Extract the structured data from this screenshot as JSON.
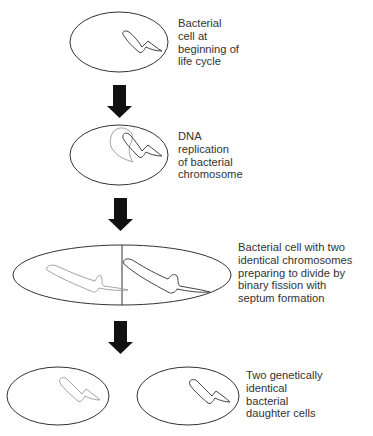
{
  "diagram": {
    "stages": [
      {
        "id": "stage-1",
        "label_lines": [
          "Bacterial",
          "cell at",
          "beginning of",
          "life cycle"
        ]
      },
      {
        "id": "stage-2",
        "label_lines": [
          "DNA",
          "replication",
          "of bacterial",
          "chromosome"
        ]
      },
      {
        "id": "stage-3",
        "label_lines": [
          "Bacterial cell with two",
          "identical chromosomes",
          "preparing to divide by",
          "binary fission with",
          "septum formation"
        ]
      },
      {
        "id": "stage-4",
        "label_lines": [
          "Two genetically",
          "identical",
          "bacterial",
          "daughter cells"
        ]
      }
    ],
    "arrows": [
      {
        "from": "stage-1",
        "to": "stage-2",
        "icon": "down-arrow-icon"
      },
      {
        "from": "stage-2",
        "to": "stage-3",
        "icon": "down-arrow-icon"
      },
      {
        "from": "stage-3",
        "to": "stage-4",
        "icon": "down-arrow-icon"
      }
    ],
    "colors": {
      "outline": "#333333",
      "chromosome_dark": "#444444",
      "chromosome_light": "#999999",
      "arrow": "#111111"
    }
  }
}
